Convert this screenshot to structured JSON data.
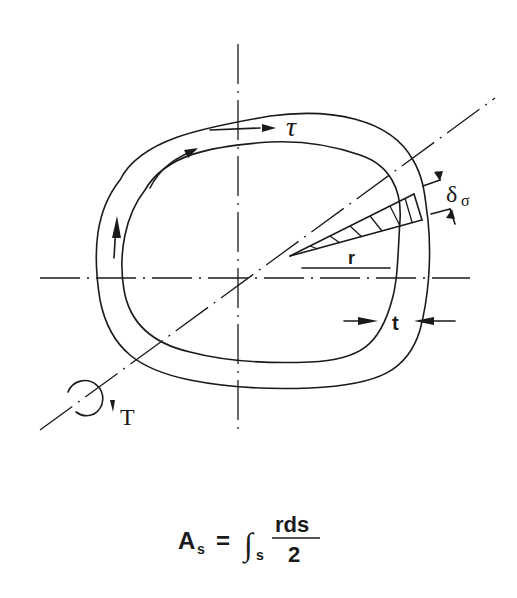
{
  "diagram": {
    "type": "closed thin-walled section under torsion",
    "labels": {
      "shear_stress": "τ",
      "torque": "T",
      "radius": "r",
      "thickness": "t",
      "delta_symbol": "δ",
      "delta_subscript": "σ"
    },
    "formula": {
      "lhs": "A",
      "lhs_subscript": "s",
      "equals": "=",
      "integral": "∫",
      "integral_subscript": "s",
      "numerator": "rds",
      "denominator": "2"
    }
  }
}
